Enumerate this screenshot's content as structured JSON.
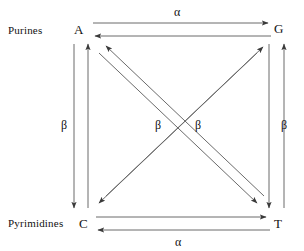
{
  "diagram": {
    "type": "state-transition-diagram",
    "groups": {
      "purines_label": "Purines",
      "pyrimidines_label": "Pyrimidines"
    },
    "nodes": [
      {
        "id": "A",
        "label": "A",
        "group": "purines",
        "x": 78,
        "y": 30
      },
      {
        "id": "G",
        "label": "G",
        "group": "purines",
        "x": 278,
        "y": 29
      },
      {
        "id": "C",
        "label": "C",
        "group": "pyrimidines",
        "x": 83,
        "y": 224
      },
      {
        "id": "T",
        "label": "T",
        "group": "pyrimidines",
        "x": 278,
        "y": 224
      }
    ],
    "edges": [
      {
        "from": "A",
        "to": "G",
        "rate": "α",
        "kind": "transition",
        "orientation": "horizontal-top"
      },
      {
        "from": "G",
        "to": "A",
        "rate": "α",
        "kind": "transition",
        "orientation": "horizontal-top"
      },
      {
        "from": "C",
        "to": "T",
        "rate": "α",
        "kind": "transition",
        "orientation": "horizontal-bottom"
      },
      {
        "from": "T",
        "to": "C",
        "rate": "α",
        "kind": "transition",
        "orientation": "horizontal-bottom"
      },
      {
        "from": "A",
        "to": "C",
        "rate": "β",
        "kind": "transversion",
        "orientation": "vertical-left"
      },
      {
        "from": "C",
        "to": "A",
        "rate": "β",
        "kind": "transversion",
        "orientation": "vertical-left"
      },
      {
        "from": "G",
        "to": "T",
        "rate": "β",
        "kind": "transversion",
        "orientation": "vertical-right"
      },
      {
        "from": "T",
        "to": "G",
        "rate": "β",
        "kind": "transversion",
        "orientation": "vertical-right"
      },
      {
        "from": "A",
        "to": "T",
        "rate": "β",
        "kind": "transversion",
        "orientation": "diagonal"
      },
      {
        "from": "T",
        "to": "A",
        "rate": "β",
        "kind": "transversion",
        "orientation": "diagonal"
      },
      {
        "from": "G",
        "to": "C",
        "rate": "β",
        "kind": "transversion",
        "orientation": "diagonal"
      },
      {
        "from": "C",
        "to": "G",
        "rate": "β",
        "kind": "transversion",
        "orientation": "diagonal"
      }
    ],
    "rate_labels": {
      "alpha_top": "α",
      "alpha_bottom": "α",
      "beta_left": "β",
      "beta_right": "β",
      "beta_mid_left": "β",
      "beta_mid_right": "β"
    },
    "colors": {
      "background": "#ffffff",
      "line": "#6b6b6b",
      "arrowhead": "#3a3a3a",
      "text": "#111111"
    }
  }
}
